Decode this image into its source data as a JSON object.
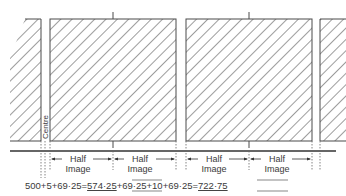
{
  "diagram": {
    "labels": {
      "centre": "Centre",
      "half": "Half",
      "image": "Image"
    },
    "half_image_segments": [
      {
        "line1": "Half",
        "line2": "Image"
      },
      {
        "line1": "Half",
        "line2": "Image"
      },
      {
        "line1": "Half",
        "line2": "Image"
      },
      {
        "line1": "Half",
        "line2": "Image"
      }
    ],
    "equation": {
      "part1": "500+5+69·25=",
      "result1": "574·25",
      "part2": "+69·25+10+69·25=",
      "result2": "722·75"
    },
    "colors": {
      "line": "#4a4a4a",
      "hatch": "#5a5a5a",
      "background": "#ffffff"
    }
  }
}
